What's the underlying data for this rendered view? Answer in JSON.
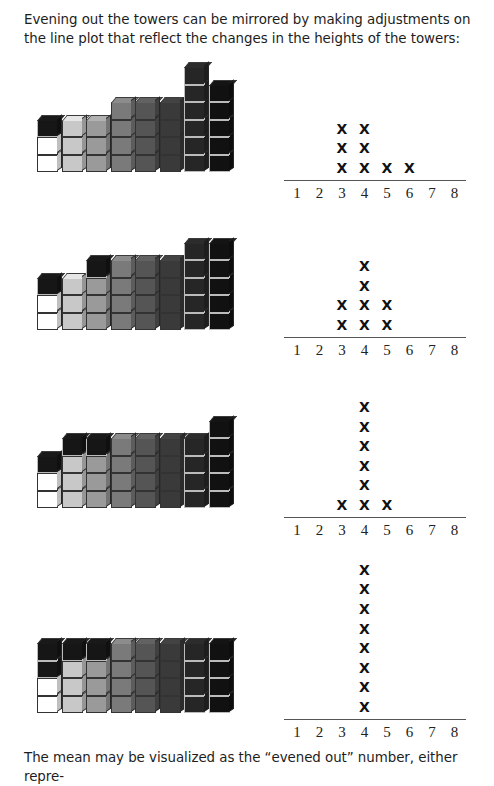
{
  "text": {
    "intro": "Evening out the towers can be mirrored by making adjustments on the line plot that reflect the changes in the heights of the towers:",
    "conclusion": "The mean may be visualized as the “evened out” number, either repre-"
  },
  "colors": {
    "white": "#ffffff",
    "light_gray": "#c8c8c8",
    "mid_gray": "#9a9a9a",
    "gray": "#7a7a7a",
    "dark_gray": "#555555",
    "darker_gray": "#3a3a3a",
    "near_black": "#262626",
    "black": "#111111",
    "moved": "#161616"
  },
  "tower_base_colors": [
    "white",
    "light_gray",
    "mid_gray",
    "gray",
    "dark_gray",
    "darker_gray",
    "near_black",
    "black"
  ],
  "chart_data": [
    {
      "type": "line-plot",
      "title": "",
      "x": [
        1,
        2,
        3,
        4,
        5,
        6,
        7,
        8
      ],
      "tower_heights": [
        3,
        3,
        3,
        4,
        4,
        4,
        6,
        5
      ],
      "tower_cubes": [
        [
          "white",
          "white",
          "moved"
        ],
        [
          "light_gray",
          "light_gray",
          "light_gray"
        ],
        [
          "mid_gray",
          "mid_gray",
          "mid_gray"
        ],
        [
          "gray",
          "gray",
          "gray",
          "gray"
        ],
        [
          "dark_gray",
          "dark_gray",
          "dark_gray",
          "dark_gray"
        ],
        [
          "darker_gray",
          "darker_gray",
          "darker_gray",
          "darker_gray"
        ],
        [
          "near_black",
          "near_black",
          "near_black",
          "near_black",
          "near_black",
          "near_black"
        ],
        [
          "black",
          "black",
          "black",
          "black",
          "black"
        ]
      ],
      "counts": {
        "3": 3,
        "4": 3,
        "5": 1,
        "6": 1
      },
      "xlabel": "",
      "ylabel": ""
    },
    {
      "type": "line-plot",
      "x": [
        1,
        2,
        3,
        4,
        5,
        6,
        7,
        8
      ],
      "tower_heights": [
        3,
        3,
        4,
        4,
        4,
        4,
        5,
        5
      ],
      "tower_cubes": [
        [
          "white",
          "white",
          "moved"
        ],
        [
          "light_gray",
          "light_gray",
          "light_gray"
        ],
        [
          "mid_gray",
          "mid_gray",
          "mid_gray",
          "moved"
        ],
        [
          "gray",
          "gray",
          "gray",
          "gray"
        ],
        [
          "dark_gray",
          "dark_gray",
          "dark_gray",
          "dark_gray"
        ],
        [
          "darker_gray",
          "darker_gray",
          "darker_gray",
          "darker_gray"
        ],
        [
          "near_black",
          "near_black",
          "near_black",
          "near_black",
          "near_black"
        ],
        [
          "black",
          "black",
          "black",
          "black",
          "black"
        ]
      ],
      "counts": {
        "3": 2,
        "4": 4,
        "5": 2
      }
    },
    {
      "type": "line-plot",
      "x": [
        1,
        2,
        3,
        4,
        5,
        6,
        7,
        8
      ],
      "tower_heights": [
        3,
        4,
        4,
        4,
        4,
        4,
        4,
        5
      ],
      "tower_cubes": [
        [
          "white",
          "white",
          "moved"
        ],
        [
          "light_gray",
          "light_gray",
          "light_gray",
          "moved"
        ],
        [
          "mid_gray",
          "mid_gray",
          "mid_gray",
          "moved"
        ],
        [
          "gray",
          "gray",
          "gray",
          "gray"
        ],
        [
          "dark_gray",
          "dark_gray",
          "dark_gray",
          "dark_gray"
        ],
        [
          "darker_gray",
          "darker_gray",
          "darker_gray",
          "darker_gray"
        ],
        [
          "near_black",
          "near_black",
          "near_black",
          "near_black"
        ],
        [
          "black",
          "black",
          "black",
          "black",
          "black"
        ]
      ],
      "counts": {
        "3": 1,
        "4": 6,
        "5": 1
      }
    },
    {
      "type": "line-plot",
      "x": [
        1,
        2,
        3,
        4,
        5,
        6,
        7,
        8
      ],
      "tower_heights": [
        4,
        4,
        4,
        4,
        4,
        4,
        4,
        4
      ],
      "tower_cubes": [
        [
          "white",
          "white",
          "moved",
          "moved"
        ],
        [
          "light_gray",
          "light_gray",
          "light_gray",
          "moved"
        ],
        [
          "mid_gray",
          "mid_gray",
          "mid_gray",
          "moved"
        ],
        [
          "gray",
          "gray",
          "gray",
          "gray"
        ],
        [
          "dark_gray",
          "dark_gray",
          "dark_gray",
          "dark_gray"
        ],
        [
          "darker_gray",
          "darker_gray",
          "darker_gray",
          "darker_gray"
        ],
        [
          "near_black",
          "near_black",
          "near_black",
          "near_black"
        ],
        [
          "black",
          "black",
          "black",
          "black"
        ]
      ],
      "counts": {
        "4": 8
      }
    }
  ],
  "layout": {
    "sections": [
      {
        "tower_bottom": 172,
        "axis_y": 180
      },
      {
        "tower_bottom": 330,
        "axis_y": 337
      },
      {
        "tower_bottom": 508,
        "axis_y": 517
      },
      {
        "tower_bottom": 713,
        "axis_y": 719
      }
    ],
    "mark_symbol": "X"
  }
}
